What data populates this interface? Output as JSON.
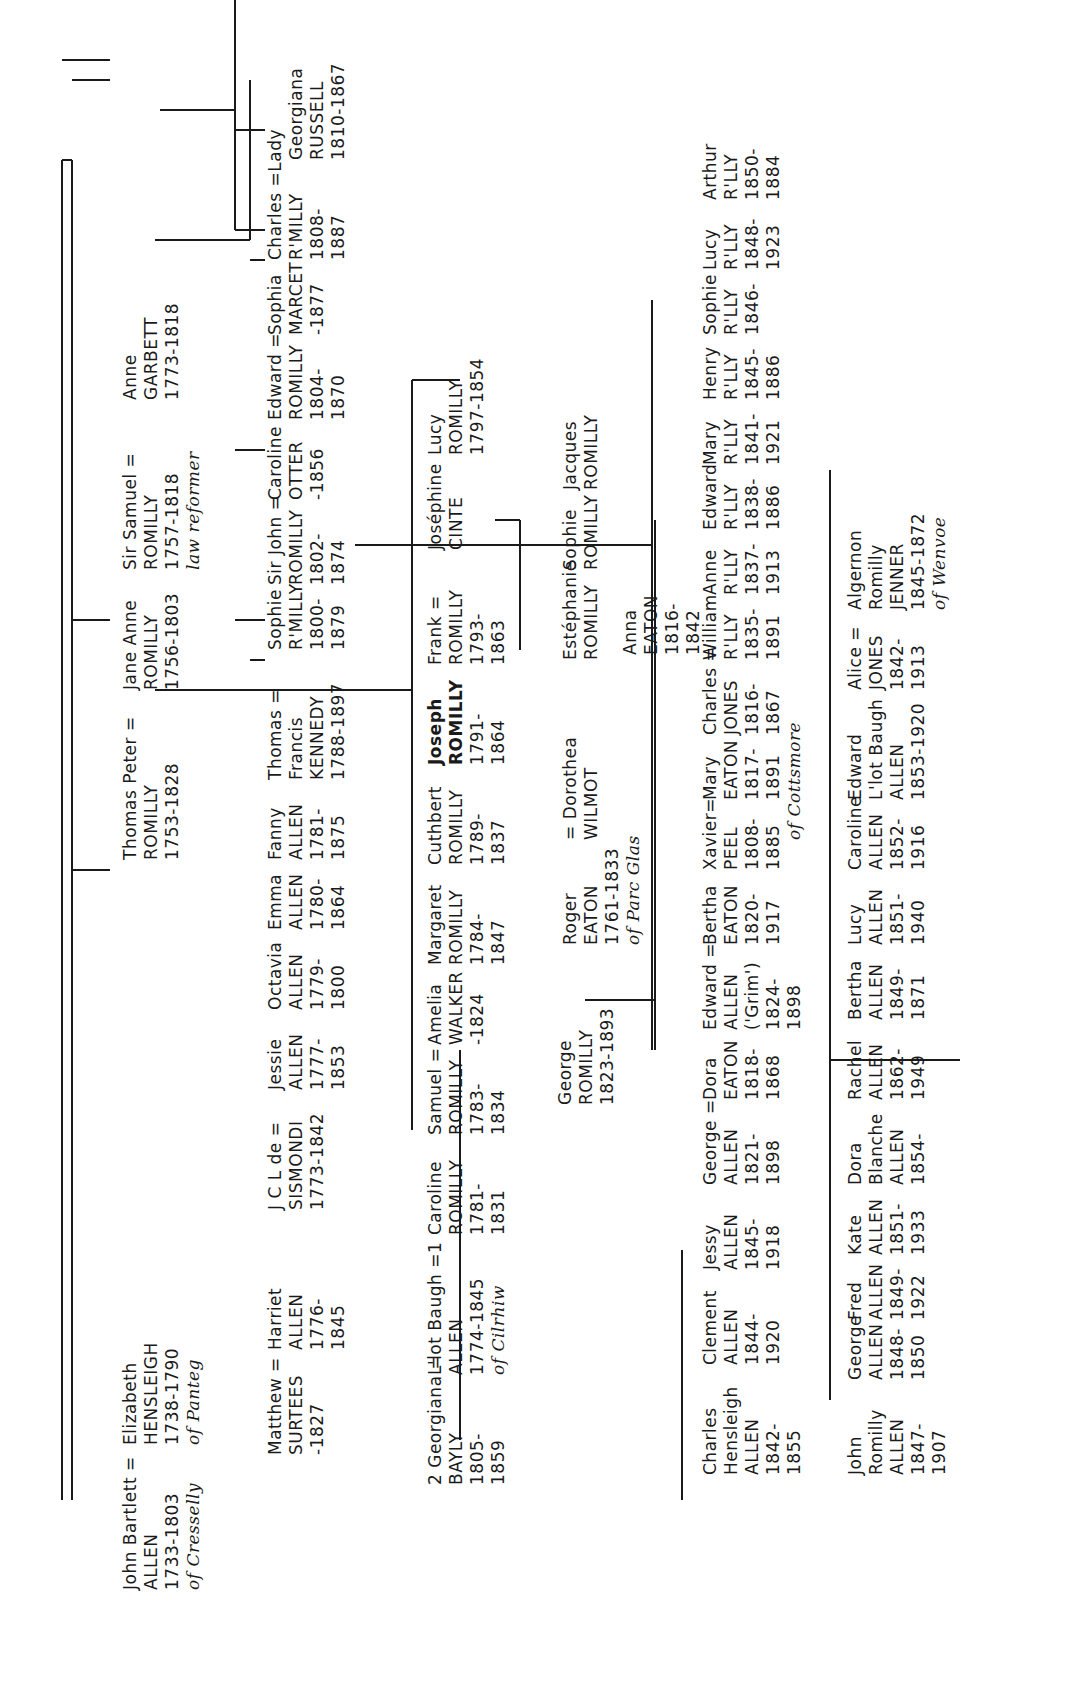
{
  "diagram": {
    "type": "family-tree",
    "orientation": "rotated-90-ccw",
    "families": [
      "ALLEN",
      "ROMILLY",
      "EATON",
      "JONES"
    ]
  },
  "people": {
    "john_bartlett": {
      "lines": [
        "John Bartlett =",
        "ALLEN",
        "1733-1803",
        "of Cresselly"
      ]
    },
    "elizabeth_hensleigh": {
      "lines": [
        "Elizabeth",
        "HENSLEIGH",
        "1738-1790",
        "of Panteg"
      ]
    },
    "thomas_peter": {
      "lines": [
        "Thomas Peter =",
        "ROMILLY",
        "1753-1828"
      ]
    },
    "jane_anne": {
      "lines": [
        "Jane Anne",
        "ROMILLY",
        "1756-1803"
      ]
    },
    "sir_samuel": {
      "lines": [
        "Sir Samuel =",
        "ROMILLY",
        "1757-1818",
        "law reformer"
      ]
    },
    "anne_garbett": {
      "lines": [
        "Anne",
        "GARBETT",
        "1773-1818"
      ]
    },
    "matthew_surtees": {
      "lines": [
        "Matthew =",
        "SURTEES",
        "-1827"
      ]
    },
    "harriet_allen": {
      "lines": [
        "Harriet",
        "ALLEN",
        "1776-",
        "1845"
      ]
    },
    "sismondi": {
      "lines": [
        "J C L de =",
        "SISMONDI",
        "1773-1842"
      ]
    },
    "jessie_allen": {
      "lines": [
        "Jessie",
        "ALLEN",
        "1777-",
        "1853"
      ]
    },
    "octavia_allen": {
      "lines": [
        "Octavia",
        "ALLEN",
        "1779-",
        "1800"
      ]
    },
    "emma_allen": {
      "lines": [
        "Emma",
        "ALLEN",
        "1780-",
        "1864"
      ]
    },
    "fanny_allen": {
      "lines": [
        "Fanny",
        "ALLEN",
        "1781-",
        "1875"
      ]
    },
    "thomas_kennedy": {
      "lines": [
        "Thomas =",
        "Francis",
        "KENNEDY",
        "1788-1897"
      ]
    },
    "sophie_rmilly": {
      "lines": [
        "Sophie",
        "R'MILLY",
        "1800-",
        "1879"
      ]
    },
    "sir_john": {
      "lines": [
        "Sir John =",
        "ROMILLY",
        "1802-",
        "1874"
      ]
    },
    "caroline_otter": {
      "lines": [
        "Caroline",
        "OTTER",
        "-1856"
      ]
    },
    "edward_romilly": {
      "lines": [
        "Edward =",
        "ROMILLY",
        "1804-",
        "1870"
      ]
    },
    "sophia_marcet": {
      "lines": [
        "Sophia",
        "MARCET",
        "-1877"
      ]
    },
    "charles_rmilly": {
      "lines": [
        "Charles =Lady",
        "R'MILLY",
        "1808-",
        "1887"
      ]
    },
    "georgiana_russell": {
      "lines": [
        "Georgiana",
        "RUSSELL",
        "1810-1867"
      ]
    },
    "georgiana_bayly": {
      "lines": [
        "2 Georgiana =",
        "BAYLY",
        "1805-",
        "1859"
      ]
    },
    "lot_baugh_allen": {
      "lines": [
        "L'lot Baugh =1",
        "ALLEN",
        "1774-1845",
        "of Cilrhiw"
      ]
    },
    "caroline_romilly": {
      "lines": [
        "Caroline",
        "ROMILLY",
        "1781-",
        "1831"
      ]
    },
    "samuel_romilly": {
      "lines": [
        "Samuel =",
        "ROMILLY",
        "1783-",
        "1834"
      ]
    },
    "amelia_walker": {
      "lines": [
        "Amelia",
        "WALKER",
        "-1824"
      ]
    },
    "margaret_romilly": {
      "lines": [
        "Margaret",
        "ROMILLY",
        "1784-",
        "1847"
      ]
    },
    "cuthbert_romilly": {
      "lines": [
        "Cuthbert",
        "ROMILLY",
        "1789-",
        "1837"
      ]
    },
    "joseph_romilly": {
      "lines": [
        "Joseph",
        "ROMILLY",
        "1791-",
        "1864"
      ],
      "emphasis": "bold"
    },
    "frank_romilly": {
      "lines": [
        "Frank =",
        "ROMILLY",
        "1793-",
        "1863"
      ]
    },
    "josephine_cinte": {
      "lines": [
        "Joséphine",
        "CINTE"
      ]
    },
    "lucy_romilly": {
      "lines": [
        "Lucy",
        "ROMILLY",
        "1797-1854"
      ]
    },
    "george_romilly": {
      "lines": [
        "George",
        "ROMILLY",
        "1823-1893"
      ]
    },
    "roger_eaton": {
      "lines": [
        "Roger",
        "EATON",
        "1761-1833",
        "of Parc Glas"
      ]
    },
    "dorothea_wilmot": {
      "lines": [
        "= Dorothea",
        "WILMOT"
      ]
    },
    "estephanie": {
      "lines": [
        "Estéphanie",
        "ROMILLY"
      ]
    },
    "sophie_romilly_fr": {
      "lines": [
        "Sophie",
        "ROMILLY"
      ]
    },
    "jacques_romilly": {
      "lines": [
        "Jacques",
        "ROMILLY"
      ]
    },
    "william_rlly": {
      "lines": [
        "William",
        "R'LLY",
        "1835-",
        "1891"
      ]
    },
    "anne_rlly": {
      "lines": [
        "Anne",
        "R'LLY",
        "1837-",
        "1913"
      ]
    },
    "edward_rlly": {
      "lines": [
        "Edward",
        "R'LLY",
        "1838-",
        "1886"
      ]
    },
    "mary_rlly": {
      "lines": [
        "Mary",
        "R'LLY",
        "1841-",
        "1921"
      ]
    },
    "henry_rlly": {
      "lines": [
        "Henry",
        "R'LLY",
        "1845-",
        "1886"
      ]
    },
    "sophie_rlly": {
      "lines": [
        "Sophie",
        "R'LLY",
        "1846-"
      ]
    },
    "lucy_rlly": {
      "lines": [
        "Lucy",
        "R'LLY",
        "1848-",
        "1923"
      ]
    },
    "arthur_rlly": {
      "lines": [
        "Arthur",
        "R'LLY",
        "1850-",
        "1884"
      ]
    },
    "charles_hensleigh": {
      "lines": [
        "Charles",
        "Hensleigh",
        "ALLEN",
        "1842-",
        "1855"
      ]
    },
    "clement_allen": {
      "lines": [
        "Clement",
        "ALLEN",
        "1844-",
        "1920"
      ]
    },
    "jessy_allen": {
      "lines": [
        "Jessy",
        "ALLEN",
        "1845-",
        "1918"
      ]
    },
    "george_allen": {
      "lines": [
        "George =",
        "ALLEN",
        "1821-",
        "1898"
      ]
    },
    "dora_eaton": {
      "lines": [
        "Dora",
        "EATON",
        "1818-",
        "1868"
      ]
    },
    "edward_allen_grim": {
      "lines": [
        "Edward =",
        "ALLEN",
        "('Grim')",
        "1824-",
        "1898"
      ]
    },
    "bertha_eaton": {
      "lines": [
        "Bertha",
        "EATON",
        "1820-",
        "1917"
      ]
    },
    "xavier_peel": {
      "lines": [
        "Xavier=",
        "PEEL",
        "1808-",
        "1885"
      ]
    },
    "mary_eaton": {
      "lines": [
        "Mary",
        "EATON",
        "1817-",
        "1891"
      ]
    },
    "cottsmore": {
      "lines": [
        "of Cottsmore"
      ]
    },
    "charles_jones": {
      "lines": [
        "Charles =",
        "JONES",
        "1816-",
        "1867"
      ]
    },
    "anna_eaton": {
      "lines": [
        "Anna",
        "EATON",
        "1816-",
        "1842"
      ]
    },
    "john_romilly_allen": {
      "lines": [
        "John",
        "Romilly",
        "ALLEN",
        "1847-",
        "1907"
      ]
    },
    "george_allen_jr": {
      "lines": [
        "George",
        "ALLEN",
        "1848-",
        "1850"
      ]
    },
    "fred_allen": {
      "lines": [
        "Fred",
        "ALLEN",
        "1849-",
        "1922"
      ]
    },
    "kate_allen": {
      "lines": [
        "Kate",
        "ALLEN",
        "1851-",
        "1933"
      ]
    },
    "dora_blanche": {
      "lines": [
        "Dora",
        "Blanche",
        "ALLEN",
        "1854-"
      ]
    },
    "rachel_allen": {
      "lines": [
        "Rachel",
        "ALLEN",
        "1862-",
        "1949"
      ]
    },
    "bertha_allen": {
      "lines": [
        "Bertha",
        "ALLEN",
        "1849-",
        "1871"
      ]
    },
    "lucy_allen": {
      "lines": [
        "Lucy",
        "ALLEN",
        "1851-",
        "1940"
      ]
    },
    "caroline_allen": {
      "lines": [
        "Caroline",
        "ALLEN",
        "1852-",
        "1916"
      ]
    },
    "edward_lot_baugh": {
      "lines": [
        "Edward",
        "L'lot Baugh",
        "ALLEN",
        "1853-1920"
      ]
    },
    "alice_jones": {
      "lines": [
        "Alice =",
        "JONES",
        "1842-",
        "1913"
      ]
    },
    "algernon_jenner": {
      "lines": [
        "Algernon",
        "Romilly",
        "JENNER",
        "1845-1872",
        "of Wenvoe"
      ]
    }
  }
}
